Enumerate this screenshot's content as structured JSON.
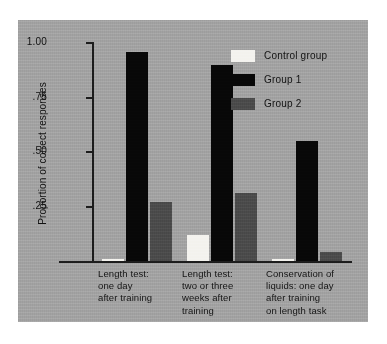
{
  "chart_data": {
    "type": "bar",
    "title": "",
    "xlabel": "",
    "ylabel": "Proportion of correct responses",
    "ylim": [
      0,
      1.0
    ],
    "ytick_labels": [
      "1.00",
      ".75",
      ".50",
      ".25"
    ],
    "ytick_values": [
      1.0,
      0.75,
      0.5,
      0.25
    ],
    "grid": false,
    "legend_position": "top-right",
    "categories": [
      "Length test: one day after training",
      "Length test: two or three weeks after training",
      "Conservation of liquids: one day after training on length task"
    ],
    "category_lines": [
      [
        "Length test:",
        "one day",
        "after training"
      ],
      [
        "Length test:",
        "two or three",
        "weeks after",
        "training"
      ],
      [
        "Conservation of",
        "liquids: one day",
        "after training",
        "on length task"
      ]
    ],
    "series": [
      {
        "name": "Control group",
        "color": "#f4f3ef",
        "values": [
          0.01,
          0.12,
          0.01
        ]
      },
      {
        "name": "Group 1",
        "color": "#080808",
        "values": [
          0.96,
          0.9,
          0.55
        ]
      },
      {
        "name": "Group 2",
        "color": "#4d4d4d",
        "values": [
          0.27,
          0.31,
          0.04
        ]
      }
    ]
  },
  "legend": {
    "items": [
      {
        "label": "Control group",
        "color": "#f4f3ef"
      },
      {
        "label": "Group 1",
        "color": "#080808"
      },
      {
        "label": "Group 2",
        "color": "#4d4d4d"
      }
    ]
  },
  "colors": {
    "panel_background": "#a5a5a5",
    "page_background": "#ffffff",
    "axis": "#1d1d1d",
    "text": "#121212"
  }
}
